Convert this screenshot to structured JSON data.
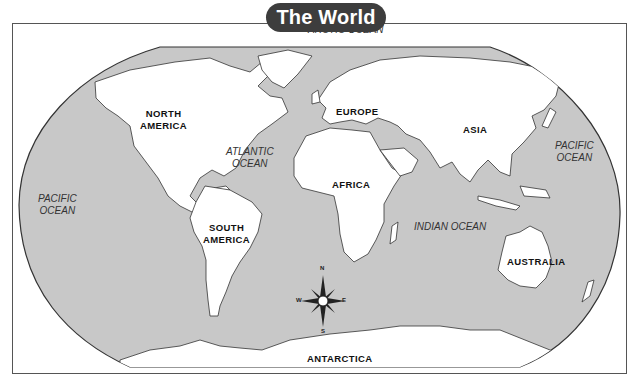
{
  "title": "The World",
  "colors": {
    "ocean": "#c8c8c8",
    "land": "#ffffff",
    "coast": "#333333",
    "title_bg": "#3d3d3d",
    "title_text": "#ffffff",
    "frame": "#555555"
  },
  "oceans": {
    "arctic": "ARCTIC OCEAN",
    "atlantic_line1": "ATLANTIC",
    "atlantic_line2": "OCEAN",
    "pacific_west_line1": "PACIFIC",
    "pacific_west_line2": "OCEAN",
    "pacific_east_line1": "PACIFIC",
    "pacific_east_line2": "OCEAN",
    "indian": "INDIAN OCEAN"
  },
  "continents": {
    "north_america_line1": "NORTH",
    "north_america_line2": "AMERICA",
    "south_america_line1": "SOUTH",
    "south_america_line2": "AMERICA",
    "europe": "EUROPE",
    "asia": "ASIA",
    "africa": "AFRICA",
    "australia": "AUSTRALIA",
    "antarctica": "ANTARCTICA"
  },
  "compass_rose": {
    "n": "N",
    "s": "S",
    "e": "E",
    "w": "W"
  }
}
